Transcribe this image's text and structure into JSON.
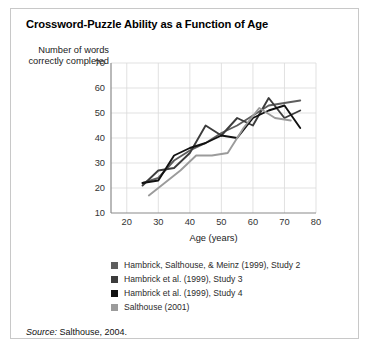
{
  "figure": {
    "title": "Crossword-Puzzle Ability as a Function of Age",
    "source_prefix": "Source:",
    "source_text": "Salthouse, 2004."
  },
  "chart_data": {
    "type": "line",
    "title": "Crossword-Puzzle Ability as a Function of Age",
    "xlabel": "Age (years)",
    "ylabel": "Number of words correctly completed",
    "xlim": [
      15,
      80
    ],
    "ylim": [
      10,
      70
    ],
    "xticks": [
      20,
      30,
      40,
      50,
      60,
      70,
      80
    ],
    "yticks": [
      10,
      20,
      30,
      40,
      50,
      60,
      70
    ],
    "grid": true,
    "legend_position": "below",
    "series": [
      {
        "name": "Hambrick, Salthouse, & Meinz (1999), Study 2",
        "color": "#5e5e5e",
        "x": [
          25,
          30,
          35,
          40,
          45,
          50,
          55,
          60,
          65,
          70,
          75
        ],
        "y": [
          22,
          24,
          31,
          35,
          38,
          42,
          45,
          49,
          53,
          54,
          55
        ]
      },
      {
        "name": "Hambrick et al. (1999), Study 3",
        "color": "#3c3c3c",
        "x": [
          25,
          30,
          35,
          40,
          45,
          50,
          55,
          60,
          65,
          70,
          75
        ],
        "y": [
          21,
          27,
          28,
          34,
          45,
          41,
          48,
          45,
          56,
          48,
          51
        ]
      },
      {
        "name": "Hambrick et al. (1999), Study 4",
        "color": "#111111",
        "x": [
          25,
          30,
          35,
          40,
          45,
          50,
          55,
          60,
          65,
          70,
          75
        ],
        "y": [
          22,
          23,
          33,
          36,
          38,
          41,
          40,
          48,
          51,
          53,
          44
        ]
      },
      {
        "name": "Salthouse (2001)",
        "color": "#9b9b9b",
        "x": [
          27,
          32,
          37,
          42,
          47,
          52,
          57,
          62,
          67,
          72
        ],
        "y": [
          17,
          22,
          27,
          33,
          33,
          34,
          44,
          52,
          48,
          47
        ]
      }
    ]
  },
  "legend": {
    "items": [
      {
        "label": "Hambrick, Salthouse, & Meinz (1999), Study 2",
        "color": "#5e5e5e"
      },
      {
        "label": "Hambrick et al. (1999), Study 3",
        "color": "#3c3c3c"
      },
      {
        "label": "Hambrick et al. (1999), Study 4",
        "color": "#111111"
      },
      {
        "label": "Salthouse (2001)",
        "color": "#9b9b9b"
      }
    ]
  }
}
